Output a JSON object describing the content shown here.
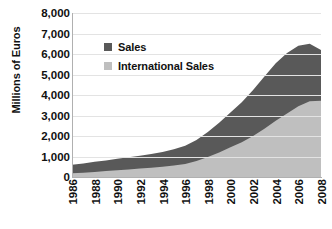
{
  "chart_data": {
    "type": "area",
    "stacked": true,
    "title": "",
    "xlabel": "",
    "ylabel": "Millions of Euros",
    "ylim": [
      0,
      8000
    ],
    "ytick_step": 1000,
    "ytick_labels": [
      "8,000",
      "7,000",
      "6,000",
      "5,000",
      "4,000",
      "3,000",
      "2,000",
      "1,000",
      "0"
    ],
    "ytick_values": [
      8000,
      7000,
      6000,
      5000,
      4000,
      3000,
      2000,
      1000,
      0
    ],
    "grid": true,
    "legend_position": "inside-top-left",
    "xlim": [
      1986,
      2008
    ],
    "x": [
      1986,
      1987,
      1988,
      1989,
      1990,
      1991,
      1992,
      1993,
      1994,
      1995,
      1996,
      1997,
      1998,
      1999,
      2000,
      2001,
      2002,
      2003,
      2004,
      2005,
      2006,
      2007,
      2008
    ],
    "xtick_labels": [
      "1986",
      "1988",
      "1990",
      "1992",
      "1994",
      "1996",
      "1998",
      "2000",
      "2002",
      "2004",
      "2006",
      "2008"
    ],
    "xtick_values": [
      1986,
      1988,
      1990,
      1992,
      1994,
      1996,
      1998,
      2000,
      2002,
      2004,
      2006,
      2008
    ],
    "series": [
      {
        "name": "International Sales",
        "color": "#bfbfbf",
        "values": [
          180,
          210,
          250,
          290,
          330,
          370,
          410,
          450,
          500,
          560,
          640,
          780,
          980,
          1200,
          1450,
          1700,
          2000,
          2350,
          2750,
          3100,
          3450,
          3700,
          3720
        ]
      },
      {
        "name": "Sales",
        "color": "#595959",
        "stack_note": "upper band; total = International Sales + Sales",
        "values": [
          420,
          450,
          490,
          520,
          560,
          590,
          630,
          670,
          720,
          790,
          880,
          1020,
          1220,
          1450,
          1700,
          1950,
          2250,
          2550,
          2800,
          2950,
          2950,
          2800,
          2480
        ]
      }
    ],
    "totals": [
      600,
      660,
      740,
      810,
      890,
      960,
      1040,
      1120,
      1220,
      1350,
      1520,
      1800,
      2200,
      2650,
      3150,
      3650,
      4250,
      4900,
      5550,
      6050,
      6400,
      6500,
      6200
    ]
  },
  "legend": {
    "items": [
      {
        "label": "Sales",
        "color": "#595959",
        "swatch_name": "legend-swatch-sales"
      },
      {
        "label": "International Sales",
        "color": "#bfbfbf",
        "swatch_name": "legend-swatch-international-sales"
      }
    ]
  }
}
